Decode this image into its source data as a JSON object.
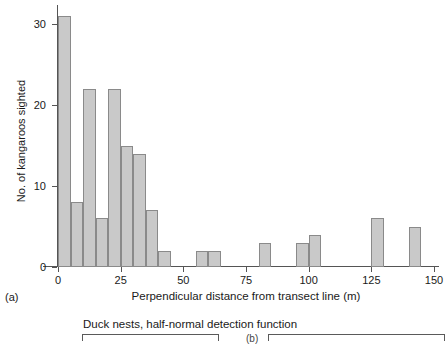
{
  "chart_data": {
    "type": "bar",
    "title": "",
    "subtitle": "",
    "xlabel": "Perpendicular distance from transect line (m)",
    "ylabel": "No. of kangaroos sighted",
    "xlim": [
      0,
      150
    ],
    "ylim": [
      0,
      32
    ],
    "bin_width": 5,
    "grid": false,
    "legend": null,
    "xticks": [
      0,
      25,
      50,
      75,
      100,
      125,
      150
    ],
    "xtick_labels": [
      "0",
      "25",
      "50",
      "75",
      "100",
      "125",
      "150"
    ],
    "yticks": [
      0,
      10,
      20,
      30
    ],
    "ytick_labels": [
      "0",
      "10",
      "20",
      "30"
    ],
    "bin_starts": [
      0,
      5,
      10,
      15,
      20,
      25,
      30,
      35,
      40,
      55,
      60,
      80,
      95,
      100,
      125,
      140
    ],
    "values": [
      31,
      8,
      22,
      6,
      22,
      15,
      14,
      7,
      2,
      2,
      2,
      3,
      3,
      4,
      6,
      5
    ],
    "bars": [
      {
        "bin_start": 0,
        "bin_end": 5,
        "value": 31
      },
      {
        "bin_start": 5,
        "bin_end": 10,
        "value": 8
      },
      {
        "bin_start": 10,
        "bin_end": 15,
        "value": 22
      },
      {
        "bin_start": 15,
        "bin_end": 20,
        "value": 6
      },
      {
        "bin_start": 20,
        "bin_end": 25,
        "value": 22
      },
      {
        "bin_start": 25,
        "bin_end": 30,
        "value": 15
      },
      {
        "bin_start": 30,
        "bin_end": 35,
        "value": 14
      },
      {
        "bin_start": 35,
        "bin_end": 40,
        "value": 7
      },
      {
        "bin_start": 40,
        "bin_end": 45,
        "value": 2
      },
      {
        "bin_start": 55,
        "bin_end": 60,
        "value": 2
      },
      {
        "bin_start": 60,
        "bin_end": 65,
        "value": 2
      },
      {
        "bin_start": 80,
        "bin_end": 85,
        "value": 3
      },
      {
        "bin_start": 95,
        "bin_end": 100,
        "value": 3
      },
      {
        "bin_start": 100,
        "bin_end": 105,
        "value": 4
      },
      {
        "bin_start": 125,
        "bin_end": 130,
        "value": 6
      },
      {
        "bin_start": 140,
        "bin_end": 145,
        "value": 5
      }
    ],
    "colors": {
      "bar_fill": "#c9c9c9",
      "bar_border": "#8a8a8a",
      "axis": "#555555",
      "text": "#1a1a1a",
      "background": "#ffffff"
    }
  },
  "figure": {
    "panel_letter": "(a)",
    "next_panel_letter": "(b)",
    "bottom_caption": "Duck nests, half-normal detection function"
  }
}
